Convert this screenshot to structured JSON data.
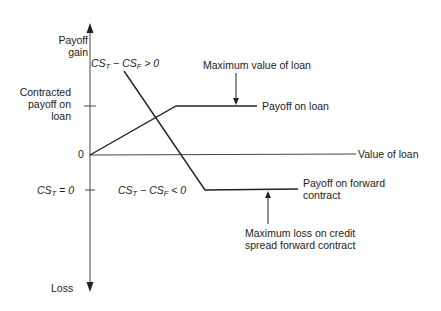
{
  "diagram": {
    "type": "payoff-diagram",
    "axes": {
      "y_top_label": "Payoff gain",
      "y_bottom_label": "Loss",
      "x_label": "Value of loan",
      "origin_label": "0",
      "y_tick_upper_label": "Contracted payoff on loan",
      "y_tick_lower_label": "CS_T = 0"
    },
    "labels": {
      "cs_positive": {
        "prefix": "CS",
        "sub1": "T",
        "mid": " − CS",
        "sub2": "F",
        "suffix": " > 0"
      },
      "cs_negative": {
        "prefix": "CS",
        "sub1": "T",
        "mid": " − CS",
        "sub2": "F",
        "suffix": " < 0"
      },
      "cs_zero": {
        "prefix": "CS",
        "sub1": "T",
        "suffix": " = 0"
      },
      "y_top_line1": "Payoff",
      "y_top_line2": "gain",
      "contracted_line1": "Contracted",
      "contracted_line2": "payoff on",
      "contracted_line3": "loan",
      "origin": "0",
      "x_axis": "Value of loan",
      "loss": "Loss",
      "max_value_loan": "Maximum value of loan",
      "payoff_loan": "Payoff on loan",
      "payoff_forward_line1": "Payoff on forward",
      "payoff_forward_line2": "contract",
      "max_loss_line1": "Maximum loss on credit",
      "max_loss_line2": "spread forward contract"
    },
    "series": [
      {
        "name": "Payoff on loan",
        "points": [
          [
            90,
            155
          ],
          [
            176,
            106
          ],
          [
            257,
            106
          ]
        ]
      },
      {
        "name": "Payoff on forward contract",
        "points": [
          [
            124,
            71
          ],
          [
            205,
            190
          ],
          [
            298,
            189
          ]
        ]
      }
    ],
    "colors": {
      "line": "#222222",
      "axis": "#444444",
      "background": "#ffffff"
    }
  }
}
